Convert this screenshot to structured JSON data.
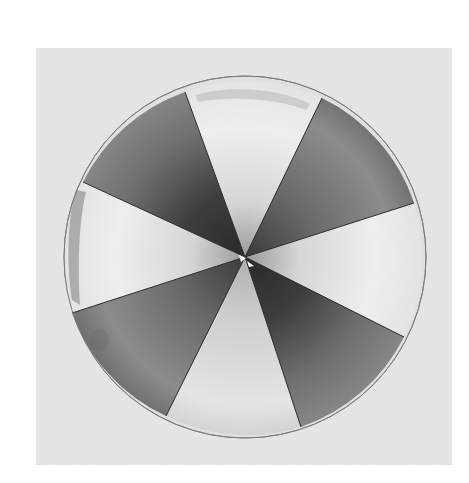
{
  "image": {
    "description": "Grayscale photograph of a circular disk divided into eight alternating light and dark wedge sectors radiating from the center, on a light gray square background",
    "background_color": "#e6e6e6",
    "page_color": "#ffffff",
    "disk": {
      "center": [
        245,
        257
      ],
      "radius": 181,
      "sectors": [
        {
          "name": "top-left",
          "tone": "dark",
          "color": "#5a5a5a"
        },
        {
          "name": "top",
          "tone": "light",
          "color": "#e4e4e4"
        },
        {
          "name": "top-right",
          "tone": "dark",
          "color": "#6a6a6a"
        },
        {
          "name": "right",
          "tone": "light",
          "color": "#e8e8e8"
        },
        {
          "name": "bottom-right",
          "tone": "dark",
          "color": "#555555"
        },
        {
          "name": "bottom",
          "tone": "light",
          "color": "#dcdcdc"
        },
        {
          "name": "bottom-left",
          "tone": "dark",
          "color": "#7a7a7a"
        },
        {
          "name": "left",
          "tone": "light",
          "color": "#f0f0f0"
        }
      ]
    }
  }
}
